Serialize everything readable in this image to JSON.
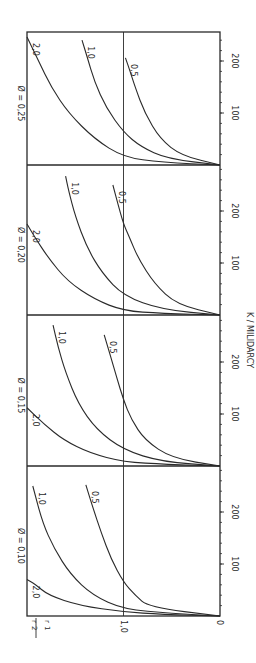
{
  "chart_data": {
    "type": "line",
    "orientation": "rotated-90-ccw",
    "xlabel": "K / MILIDARCY",
    "ylabel": "r2 / r1",
    "ylabel_numerator": "r",
    "ylabel_numerator_sub": "2",
    "ylabel_denominator": "r",
    "ylabel_denominator_sub": "1",
    "ylim": [
      0,
      2.0
    ],
    "y_ticks": [
      {
        "value": 0,
        "label": "0"
      },
      {
        "value": 1.0,
        "label": "1,0"
      }
    ],
    "reference_line": 1.0,
    "xlim": [
      0,
      290
    ],
    "x_ticks": [
      {
        "value": 100,
        "label": "100"
      },
      {
        "value": 200,
        "label": "200"
      }
    ],
    "x_minor_tick_step": 20,
    "grid": false,
    "panels": [
      {
        "title": "Ø = 0,10",
        "porosity": 0.1,
        "series": [
          {
            "name": "2,0",
            "points": [
              [
                0,
                0
              ],
              [
                3,
                0.6
              ],
              [
                8,
                1.0
              ],
              [
                20,
                1.45
              ],
              [
                40,
                1.78
              ],
              [
                62,
                1.92
              ],
              [
                70,
                2.0
              ]
            ]
          },
          {
            "name": "1,0",
            "points": [
              [
                0,
                0
              ],
              [
                5,
                0.5
              ],
              [
                13,
                1.0
              ],
              [
                40,
                1.32
              ],
              [
                80,
                1.55
              ],
              [
                130,
                1.72
              ],
              [
                180,
                1.84
              ],
              [
                250,
                1.94
              ]
            ]
          },
          {
            "name": "0,5",
            "points": [
              [
                0,
                0
              ],
              [
                17,
                0.74
              ],
              [
                40,
                0.88
              ],
              [
                65,
                1.0
              ],
              [
                110,
                1.13
              ],
              [
                160,
                1.23
              ],
              [
                210,
                1.32
              ],
              [
                252,
                1.39
              ]
            ]
          }
        ]
      },
      {
        "title": "Ø = 0,15",
        "porosity": 0.15,
        "series": [
          {
            "name": "2,0",
            "points": [
              [
                0,
                0
              ],
              [
                3,
                0.55
              ],
              [
                8,
                1.0
              ],
              [
                25,
                1.35
              ],
              [
                50,
                1.62
              ],
              [
                80,
                1.82
              ],
              [
                112,
                2.0
              ]
            ]
          },
          {
            "name": "1,0",
            "points": [
              [
                0,
                0
              ],
              [
                8,
                0.6
              ],
              [
                31,
                1.0
              ],
              [
                70,
                1.28
              ],
              [
                120,
                1.47
              ],
              [
                180,
                1.6
              ],
              [
                230,
                1.68
              ],
              [
                271,
                1.73
              ]
            ]
          },
          {
            "name": "0,5",
            "points": [
              [
                0,
                0
              ],
              [
                15,
                0.5
              ],
              [
                50,
                0.78
              ],
              [
                90,
                0.92
              ],
              [
                127,
                1.0
              ],
              [
                170,
                1.07
              ],
              [
                215,
                1.14
              ],
              [
                252,
                1.2
              ]
            ]
          }
        ]
      },
      {
        "title": "Ø = 0,20",
        "porosity": 0.2,
        "series": [
          {
            "name": "2,0",
            "points": [
              [
                0,
                0
              ],
              [
                3,
                0.6
              ],
              [
                8,
                1.0
              ],
              [
                30,
                1.3
              ],
              [
                65,
                1.58
              ],
              [
                110,
                1.78
              ],
              [
                150,
                1.92
              ],
              [
                175,
                2.0
              ]
            ]
          },
          {
            "name": "1,0",
            "points": [
              [
                0,
                0
              ],
              [
                10,
                0.6
              ],
              [
                37,
                1.0
              ],
              [
                80,
                1.22
              ],
              [
                130,
                1.38
              ],
              [
                190,
                1.5
              ],
              [
                240,
                1.57
              ],
              [
                267,
                1.6
              ]
            ]
          },
          {
            "name": "0,5",
            "points": [
              [
                0,
                0
              ],
              [
                20,
                0.45
              ],
              [
                60,
                0.68
              ],
              [
                110,
                0.85
              ],
              [
                150,
                0.94
              ],
              [
                175,
                1.0
              ],
              [
                215,
                1.06
              ],
              [
                250,
                1.11
              ]
            ]
          }
        ]
      },
      {
        "title": "Ø = 0,25",
        "porosity": 0.25,
        "series": [
          {
            "name": "2,0",
            "points": [
              [
                0,
                0
              ],
              [
                5,
                0.6
              ],
              [
                15,
                1.0
              ],
              [
                50,
                1.3
              ],
              [
                100,
                1.57
              ],
              [
                150,
                1.75
              ],
              [
                200,
                1.88
              ],
              [
                246,
                2.0
              ]
            ]
          },
          {
            "name": "1,0",
            "points": [
              [
                0,
                0
              ],
              [
                12,
                0.55
              ],
              [
                35,
                0.82
              ],
              [
                63,
                1.0
              ],
              [
                110,
                1.18
              ],
              [
                160,
                1.3
              ],
              [
                210,
                1.38
              ],
              [
                240,
                1.43
              ]
            ]
          },
          {
            "name": "0,5",
            "points": [
              [
                0,
                0
              ],
              [
                18,
                0.4
              ],
              [
                50,
                0.62
              ],
              [
                100,
                0.78
              ],
              [
                150,
                0.88
              ],
              [
                185,
                0.94
              ],
              [
                206,
                0.98
              ]
            ]
          }
        ]
      }
    ]
  }
}
